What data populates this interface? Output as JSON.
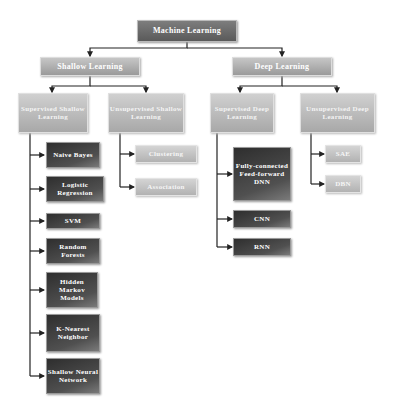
{
  "diagram": {
    "root": {
      "label": "Machine Learning"
    },
    "level1": {
      "shallow": {
        "label": "Shallow Learning"
      },
      "deep": {
        "label": "Deep Learning"
      }
    },
    "level2": {
      "supervised_shallow": {
        "label": "Supervised Shallow Learning"
      },
      "unsupervised_shallow": {
        "label": "Unsupervised Shallow Learning"
      },
      "supervised_deep": {
        "label": "Supervised Deep Learning"
      },
      "unsupervised_deep": {
        "label": "Unsupervised Deep Learning"
      }
    },
    "supervised_shallow_methods": [
      {
        "label": "Naive Bayes"
      },
      {
        "label": "Logistic Regression"
      },
      {
        "label": "SVM"
      },
      {
        "label": "Random Forests"
      },
      {
        "label": "Hidden Markov Models"
      },
      {
        "label": "K-Nearest Neighbor"
      },
      {
        "label": "Shallow Neural Network"
      }
    ],
    "unsupervised_shallow_methods": [
      {
        "label": "Clustering"
      },
      {
        "label": "Association"
      }
    ],
    "supervised_deep_methods": [
      {
        "label": "Fully-connected Feed-forward DNN"
      },
      {
        "label": "CNN"
      },
      {
        "label": "RNN"
      }
    ],
    "unsupervised_deep_methods": [
      {
        "label": "SAE"
      },
      {
        "label": "DBN"
      }
    ]
  }
}
